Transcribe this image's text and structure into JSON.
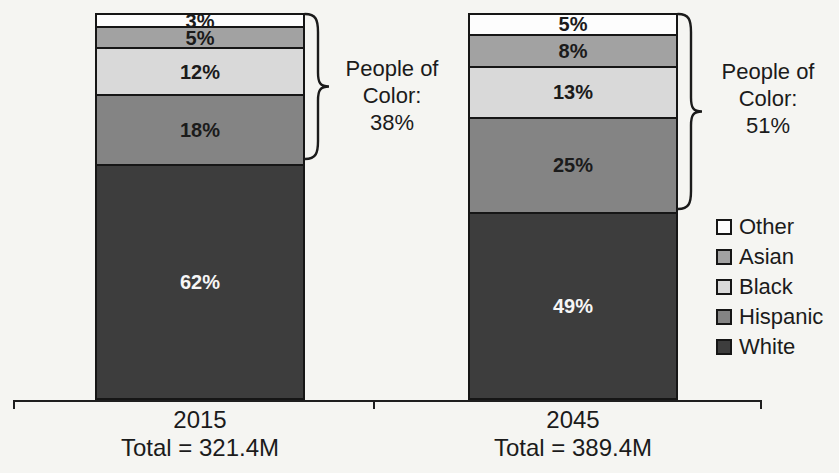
{
  "chart_data": {
    "type": "bar",
    "variant": "stacked-100-percent-column",
    "title": "",
    "unit": "%",
    "categories": [
      "2015",
      "2045"
    ],
    "category_sublabels": [
      "Total = 321.4M",
      "Total = 389.4M"
    ],
    "stack_order_top_to_bottom": [
      "Other",
      "Asian",
      "Black",
      "Hispanic",
      "White"
    ],
    "series": [
      {
        "name": "Other",
        "values": [
          3,
          5
        ],
        "display_values": [
          "3%",
          "5%"
        ],
        "color": "#fdfdfd",
        "label_color": "#1b1b1b"
      },
      {
        "name": "Asian",
        "values": [
          5,
          8
        ],
        "display_values": [
          "5%",
          "8%"
        ],
        "color": "#a2a2a2",
        "label_color": "#1b1b1b"
      },
      {
        "name": "Black",
        "values": [
          12,
          13
        ],
        "display_values": [
          "12%",
          "13%"
        ],
        "color": "#d9d9d9",
        "label_color": "#1b1b1b"
      },
      {
        "name": "Hispanic",
        "values": [
          18,
          25
        ],
        "display_values": [
          "18%",
          "25%"
        ],
        "color": "#848484",
        "label_color": "#1b1b1b"
      },
      {
        "name": "White",
        "values": [
          62,
          49
        ],
        "display_values": [
          "62%",
          "49%"
        ],
        "color": "#3d3d3d",
        "label_color": "#f6f6f6"
      }
    ],
    "legend": {
      "position": "right",
      "items": [
        "Other",
        "Asian",
        "Black",
        "Hispanic",
        "White"
      ]
    },
    "annotations": [
      {
        "category": "2015",
        "lines": [
          "People of",
          "Color:",
          "38%"
        ],
        "total_percent": 38,
        "brace_covers_top_series_count": 4
      },
      {
        "category": "2045",
        "lines": [
          "People of",
          "Color:",
          "51%"
        ],
        "total_percent": 51,
        "brace_covers_top_series_count": 4
      }
    ],
    "axes": {
      "y_axis_shown": false,
      "x_baseline_shown": true,
      "x_tick_count": 3
    }
  },
  "colors": {
    "ink": "#1b1b1b",
    "background": "#f5f5f2"
  }
}
